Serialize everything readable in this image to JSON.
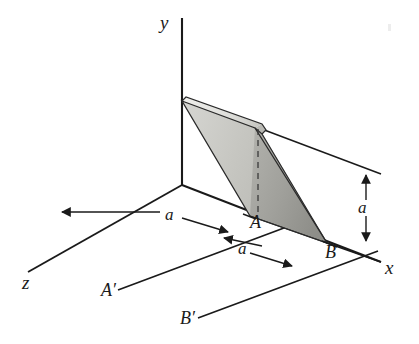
{
  "figure": {
    "background_color": "#ffffff",
    "line_color": "#1a1a1a",
    "axes": [
      {
        "id": "y",
        "label": "y",
        "direction": "vertical-up"
      },
      {
        "id": "x",
        "label": "x",
        "direction": "right-down"
      },
      {
        "id": "z",
        "label": "z",
        "direction": "left-down"
      }
    ],
    "points": [
      {
        "id": "A",
        "label": "A"
      },
      {
        "id": "B",
        "label": "B"
      },
      {
        "id": "A-prime",
        "label": "A′"
      },
      {
        "id": "B-prime",
        "label": "B′"
      }
    ],
    "dimensions": [
      {
        "id": "dim-z-offset",
        "label": "a",
        "orientation": "along-z"
      },
      {
        "id": "dim-x-offset",
        "label": "a",
        "orientation": "along-x"
      },
      {
        "id": "dim-height",
        "label": "a",
        "orientation": "vertical"
      }
    ],
    "plate": {
      "name": "inclined-plate",
      "face_light_color": "#c9c9c4",
      "face_dark_color": "#a8a8a4",
      "edge_top_color": "#e2e2de",
      "outline_color": "#1a1a1a",
      "hidden_edge_style": "dashed"
    }
  }
}
